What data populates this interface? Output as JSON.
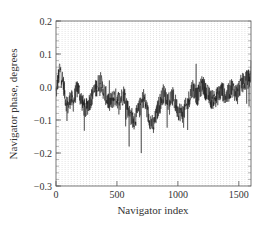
{
  "chart_data": {
    "type": "line",
    "title": "",
    "xlabel": "Navigator index",
    "ylabel": "Navigator phase, degrees",
    "xlim": [
      0,
      1600
    ],
    "ylim": [
      -0.3,
      0.2
    ],
    "xticks": [
      0,
      500,
      1000,
      1500
    ],
    "xtick_labels": [
      "0",
      "500",
      "1000",
      "1500"
    ],
    "yticks": [
      0.2,
      0.1,
      0.0,
      -0.1,
      -0.2,
      -0.3
    ],
    "ytick_labels": [
      "0.2",
      "0.1",
      "0.0",
      "−0.1",
      "−0.2",
      "−0.3"
    ],
    "grid": {
      "vertical": true,
      "horizontal_minor_ticks": true,
      "vertical_spacing": 25
    },
    "legend": null,
    "series": [
      {
        "name": "Navigator phase",
        "color": "#111111",
        "x": [
          0,
          20,
          40,
          60,
          80,
          100,
          120,
          140,
          160,
          180,
          200,
          240,
          280,
          320,
          360,
          400,
          440,
          480,
          520,
          560,
          600,
          640,
          680,
          720,
          760,
          800,
          840,
          880,
          920,
          960,
          1000,
          1040,
          1080,
          1120,
          1160,
          1200,
          1240,
          1280,
          1320,
          1360,
          1400,
          1440,
          1480,
          1520,
          1560,
          1600
        ],
        "values": [
          -0.02,
          0.03,
          0.05,
          0.01,
          -0.04,
          -0.06,
          -0.03,
          -0.05,
          -0.02,
          0.0,
          -0.03,
          -0.07,
          -0.04,
          -0.01,
          0.02,
          -0.02,
          -0.05,
          -0.03,
          -0.04,
          -0.02,
          -0.08,
          -0.1,
          -0.07,
          -0.03,
          -0.09,
          -0.12,
          -0.06,
          -0.02,
          -0.04,
          -0.03,
          -0.07,
          -0.08,
          -0.05,
          0.0,
          -0.03,
          0.01,
          -0.02,
          -0.04,
          -0.03,
          -0.01,
          -0.03,
          0.0,
          -0.02,
          0.01,
          0.02,
          0.03
        ],
        "envelope_min": -0.2,
        "envelope_max": 0.08,
        "notable_spikes": [
          {
            "x": 30,
            "y": 0.07
          },
          {
            "x": 600,
            "y": -0.18
          },
          {
            "x": 700,
            "y": -0.2
          },
          {
            "x": 1150,
            "y": 0.07
          },
          {
            "x": 1600,
            "y": 0.08
          }
        ]
      }
    ]
  },
  "colors": {
    "line": "#111111",
    "grid": "#c8c8c8",
    "axis": "#555555",
    "background": "#ffffff"
  }
}
